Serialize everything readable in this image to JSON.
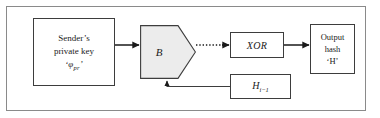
{
  "figure": {
    "type": "block-diagram",
    "frame": {
      "visible": true,
      "border_color": "#8a8a8a"
    },
    "accent_fill": "#ececec",
    "line_color": "#1a1a1a"
  },
  "nodes": {
    "private_key": {
      "shape": "rectangle",
      "line1": "Sender’s",
      "line2": "private key",
      "symbol_open_quote": "‘",
      "symbol_letter": "φ",
      "symbol_subscript": "pr",
      "symbol_close_quote": "’"
    },
    "block_b": {
      "shape": "pentagon-arrow",
      "label": "B"
    },
    "xor": {
      "shape": "rectangle",
      "label": "XOR"
    },
    "output_hash": {
      "shape": "rectangle",
      "line1": "Output",
      "line2": "hash",
      "line3": "‘H’"
    },
    "prev_hash": {
      "shape": "rectangle",
      "label_letter": "H",
      "label_subscript": "i−1"
    }
  },
  "edges": [
    {
      "name": "private-key-to-b",
      "style": "solid",
      "arrow": true
    },
    {
      "name": "b-to-xor",
      "style": "dotted",
      "arrow": true
    },
    {
      "name": "xor-to-output",
      "style": "solid",
      "arrow": true
    },
    {
      "name": "prev-hash-feedback-to-b",
      "style": "solid",
      "arrow": true
    }
  ]
}
